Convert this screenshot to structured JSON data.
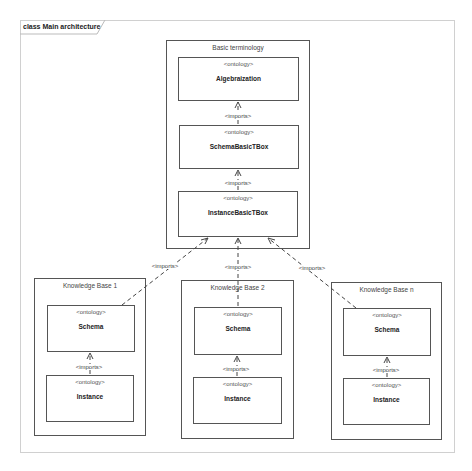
{
  "diagram": {
    "frame_title": "class Main architecture",
    "basic_package": {
      "title": "Basic terminology",
      "ontologies": [
        {
          "stereotype": "<ontology>",
          "name": "Algebraization"
        },
        {
          "stereotype": "<ontology>",
          "name": "SchemaBasicTBox"
        },
        {
          "stereotype": "<ontology>",
          "name": "InstanceBasicTBox"
        }
      ]
    },
    "knowledge_bases": [
      {
        "title": "Knowledge Base 1",
        "schema": {
          "stereotype": "<ontology>",
          "name": "Schema"
        },
        "instance": {
          "stereotype": "<ontology>",
          "name": "Instance"
        }
      },
      {
        "title": "Knowledge Base 2",
        "schema": {
          "stereotype": "<ontology>",
          "name": "Schema"
        },
        "instance": {
          "stereotype": "<ontology>",
          "name": "Instance"
        }
      },
      {
        "title": "Knowledge Base n",
        "schema": {
          "stereotype": "<ontology>",
          "name": "Schema"
        },
        "instance": {
          "stereotype": "<ontology>",
          "name": "Instance"
        }
      }
    ],
    "relation_label": "<imports>",
    "colors": {
      "line": "#555555",
      "frame": "#d0d0d0",
      "background": "#ffffff"
    }
  }
}
